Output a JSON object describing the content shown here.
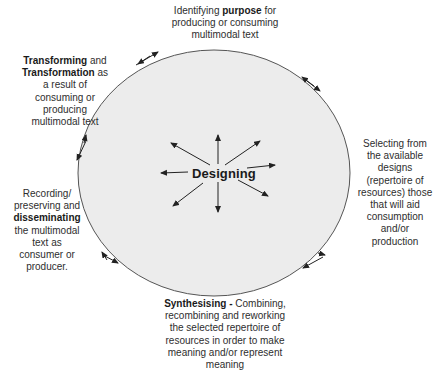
{
  "diagram": {
    "center": {
      "label": "Designing"
    },
    "nodes": {
      "top": {
        "bold": "purpose",
        "pre": "Identifying ",
        "post": " for producing or consuming multimodal text"
      },
      "top_left": {
        "bold1": "Transforming",
        "mid": " and ",
        "bold2": "Transformation",
        "post": " as a result of consuming or producing multimodal text"
      },
      "right": {
        "text": "Selecting from the available designs (repertoire of resources) those that will aid consumption and/or production"
      },
      "left": {
        "pre": "Recording/ preserving and ",
        "bold": "disseminating",
        "post": " the multimodal text as consumer or producer."
      },
      "bottom": {
        "bold": "Synthesising - ",
        "post": "Combining, recombining and reworking the selected repertoire of resources in order to make meaning and/or represent meaning"
      }
    },
    "colors": {
      "ellipse_fill": "#ececec",
      "ellipse_stroke": "#555555",
      "arrow": "#222222"
    }
  }
}
